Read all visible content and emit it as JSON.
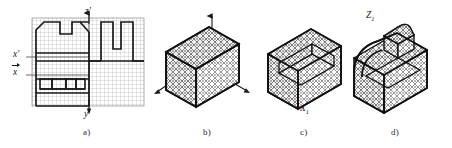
{
  "figure": {
    "type": "engineering-drawing",
    "background_color": "#ffffff",
    "line_color": "#1a1a1a",
    "grid_color": "#9a9a9a",
    "mesh_color": "#4a4a4a"
  },
  "captions": {
    "a": "a)",
    "b": "b)",
    "c": "c)",
    "d": "d)"
  },
  "panel_a": {
    "name": "orthographic-grid-views",
    "grid": {
      "cols": 28,
      "rows": 22,
      "cell_px": 4
    },
    "axes": [
      {
        "id": "z-prime",
        "label": "z",
        "prime": true,
        "direction": "up",
        "position": "top-center"
      },
      {
        "id": "y",
        "label": "y",
        "prime": false,
        "direction": "down",
        "position": "bottom-center"
      },
      {
        "id": "x-prime",
        "label": "x",
        "prime": true,
        "direction": "right",
        "position": "left-upper"
      },
      {
        "id": "x-vector",
        "label": "x",
        "vector": true,
        "direction": "right",
        "position": "left-lower"
      }
    ]
  },
  "panel_b": {
    "name": "isometric-meshed-block",
    "axes": [
      {
        "id": "Z1",
        "label": "Z",
        "sub": "1",
        "direction": "up"
      },
      {
        "id": "Y1",
        "label": "Y",
        "sub": "1",
        "direction": "right-down"
      },
      {
        "id": "X1",
        "label": "X",
        "sub": "1",
        "direction": "left-down"
      }
    ],
    "shape": "rectangular-block"
  },
  "panel_c": {
    "name": "isometric-block-with-step",
    "shape": "block-with-step-cut"
  },
  "panel_d": {
    "name": "isometric-finished-part",
    "shape": "block-with-chamfer-and-boss"
  }
}
